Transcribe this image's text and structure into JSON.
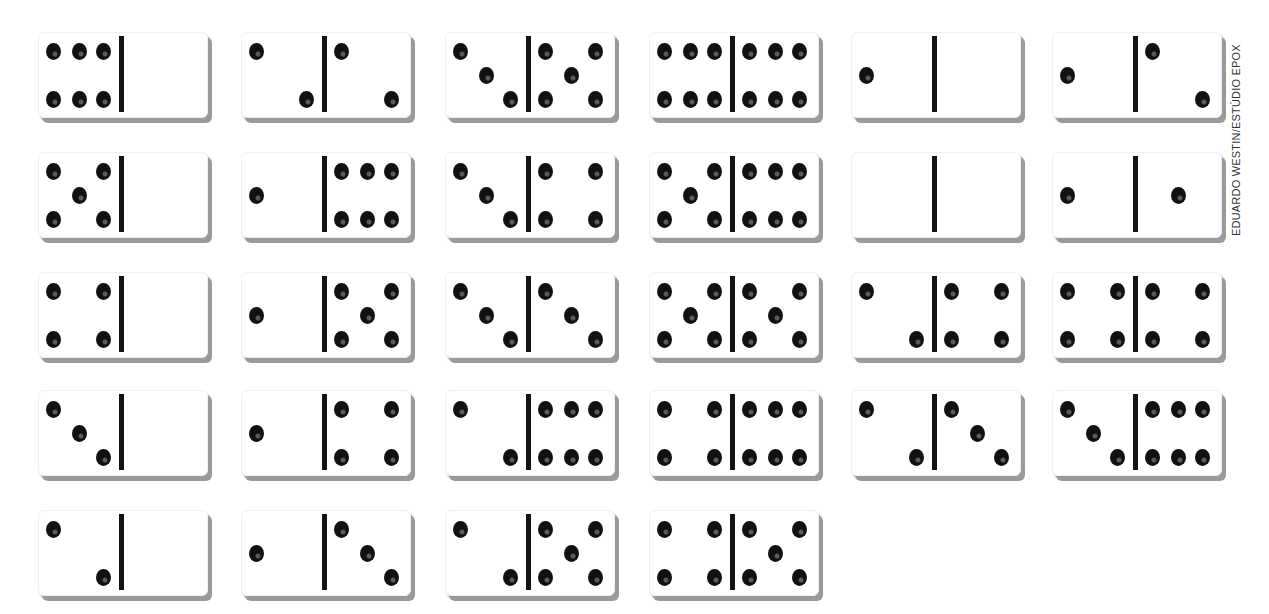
{
  "credit": "EDUARDO WESTIN/ESTÚDIO EPOX",
  "colors": {
    "pip": "#111111",
    "divider": "#141414",
    "shadow": "#9a9a9a",
    "tile": "#ffffff"
  },
  "layout": {
    "columns_x": [
      38,
      241,
      445,
      649,
      851,
      1052
    ],
    "rows_y": [
      32,
      152,
      272,
      390,
      510
    ]
  },
  "dominoes": [
    {
      "row": 0,
      "col": 0,
      "left": 6,
      "right": 0
    },
    {
      "row": 0,
      "col": 1,
      "left": 2,
      "right": 2
    },
    {
      "row": 0,
      "col": 2,
      "left": 3,
      "right": 5
    },
    {
      "row": 0,
      "col": 3,
      "left": 6,
      "right": 6
    },
    {
      "row": 0,
      "col": 4,
      "left": 1,
      "right": 0
    },
    {
      "row": 0,
      "col": 5,
      "left": 1,
      "right": 2
    },
    {
      "row": 1,
      "col": 0,
      "left": 5,
      "right": 0
    },
    {
      "row": 1,
      "col": 1,
      "left": 1,
      "right": 6
    },
    {
      "row": 1,
      "col": 2,
      "left": 3,
      "right": 4
    },
    {
      "row": 1,
      "col": 3,
      "left": 5,
      "right": 6
    },
    {
      "row": 1,
      "col": 4,
      "left": 0,
      "right": 0
    },
    {
      "row": 1,
      "col": 5,
      "left": 1,
      "right": 1
    },
    {
      "row": 2,
      "col": 0,
      "left": 4,
      "right": 0
    },
    {
      "row": 2,
      "col": 1,
      "left": 1,
      "right": 5
    },
    {
      "row": 2,
      "col": 2,
      "left": 3,
      "right": 3
    },
    {
      "row": 2,
      "col": 3,
      "left": 5,
      "right": 5
    },
    {
      "row": 2,
      "col": 4,
      "left": 2,
      "right": 4
    },
    {
      "row": 2,
      "col": 5,
      "left": 4,
      "right": 4
    },
    {
      "row": 3,
      "col": 0,
      "left": 3,
      "right": 0
    },
    {
      "row": 3,
      "col": 1,
      "left": 1,
      "right": 4
    },
    {
      "row": 3,
      "col": 2,
      "left": 2,
      "right": 6
    },
    {
      "row": 3,
      "col": 3,
      "left": 4,
      "right": 6
    },
    {
      "row": 3,
      "col": 4,
      "left": 2,
      "right": 3
    },
    {
      "row": 3,
      "col": 5,
      "left": 3,
      "right": 6
    },
    {
      "row": 4,
      "col": 0,
      "left": 2,
      "right": 0
    },
    {
      "row": 4,
      "col": 1,
      "left": 1,
      "right": 3
    },
    {
      "row": 4,
      "col": 2,
      "left": 2,
      "right": 5
    },
    {
      "row": 4,
      "col": 3,
      "left": 4,
      "right": 5
    }
  ]
}
